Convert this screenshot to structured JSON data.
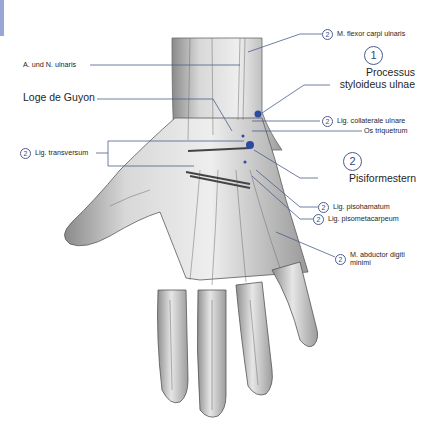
{
  "figure": {
    "accent_color": "#3b5da8",
    "line_color": "#4a5d8c",
    "edge_tab_color": "#9aa6d6"
  },
  "labels_left": [
    {
      "id": "a-n-ulnaris",
      "text": "A. und N. ulnaris"
    },
    {
      "id": "loge-de-guyon",
      "text": "Loge de Guyon"
    },
    {
      "id": "lig-transversum",
      "badge": "2",
      "text": "Lig. transversum"
    }
  ],
  "labels_right": [
    {
      "id": "m-flexor-carpi-ulnaris",
      "badge": "2",
      "text": "M. flexor carpi ulnaris"
    },
    {
      "id": "processus-styloideus-ulnae",
      "badge": "1",
      "text_line1": "Processus",
      "text_line2": "styloideus ulnae"
    },
    {
      "id": "lig-collaterale-ulnare",
      "badge": "2",
      "text": "Lig. collaterale ulnare"
    },
    {
      "id": "os-triquetrum",
      "text": "Os triquetrum"
    },
    {
      "id": "pisiformestern",
      "badge": "2",
      "text": "Pisiformestern"
    },
    {
      "id": "lig-pisohamatum",
      "badge": "2",
      "text": "Lig. pisohamatum"
    },
    {
      "id": "lig-pisometacarpeum",
      "badge": "2",
      "text": "Lig. pisometacarpeum"
    },
    {
      "id": "m-abductor-digiti-minimi",
      "badge": "2",
      "text_line1": "M. abductor digiti",
      "text_line2": "minimi"
    }
  ]
}
